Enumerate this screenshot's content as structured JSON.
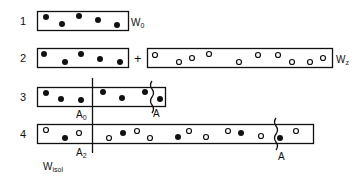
{
  "rows": [
    {
      "label": "1",
      "side_label": "W",
      "side_sub": "0"
    },
    {
      "label": "2",
      "operator": "+",
      "side_label": "W",
      "side_sub": "z"
    },
    {
      "label": "3",
      "marker_left": "A",
      "marker_left_sub": "0",
      "marker_right": "A"
    },
    {
      "label": "4",
      "marker_left": "A",
      "marker_left_sub": "2",
      "marker_right": "A",
      "bottom_label": "W",
      "bottom_sub": "isol"
    }
  ],
  "legend": {
    "filled": "filled-circle",
    "open": "open-circle"
  }
}
